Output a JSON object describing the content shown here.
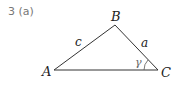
{
  "problem": {
    "number": "3",
    "part": "(a)"
  },
  "diagram": {
    "type": "triangle",
    "vertices": {
      "A": {
        "label": "A",
        "x": 54,
        "y": 70
      },
      "B": {
        "label": "B",
        "x": 115,
        "y": 25
      },
      "C": {
        "label": "C",
        "x": 158,
        "y": 70
      }
    },
    "sides": {
      "c": "c",
      "a": "a"
    },
    "angle": {
      "label": "γ",
      "at": "C"
    },
    "stroke_color": "#333333",
    "label_color": "#222222",
    "angle_color": "#666666"
  }
}
